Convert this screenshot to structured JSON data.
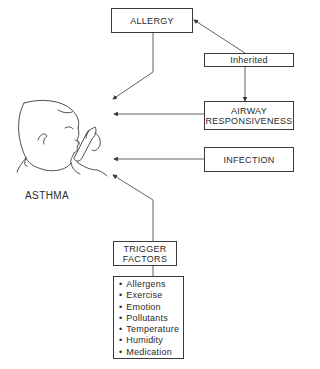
{
  "diagram": {
    "center_label": "ASTHMA",
    "boxes": {
      "allergy": "ALLERGY",
      "inherited": "Inherited",
      "airway_line1": "AIRWAY",
      "airway_line2": "RESPONSIVENESS",
      "infection": "INFECTION",
      "trigger_line1": "TRIGGER",
      "trigger_line2": "FACTORS"
    },
    "trigger_factors": [
      "Allergens",
      "Exercise",
      "Emotion",
      "Pollutants",
      "Temperature",
      "Humidity",
      "Medication"
    ],
    "illustration": "child-using-inhaler",
    "colors": {
      "line": "#3a3a3a",
      "background": "#ffffff"
    }
  }
}
